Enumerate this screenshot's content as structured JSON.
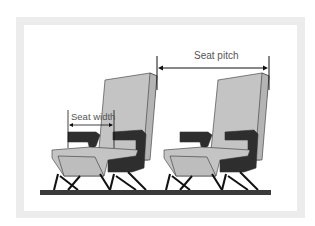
{
  "diagram": {
    "labels": {
      "seat_pitch": "Seat pitch",
      "seat_width": "Seat width"
    },
    "seats": [
      {
        "name": "front-seat"
      },
      {
        "name": "rear-seat"
      }
    ],
    "colors": {
      "frame": "#ececec",
      "seat_light": "#c4c4c4",
      "seat_dark": "#2e2e2e",
      "floor": "#3a3a3a",
      "outline": "#333333"
    }
  }
}
